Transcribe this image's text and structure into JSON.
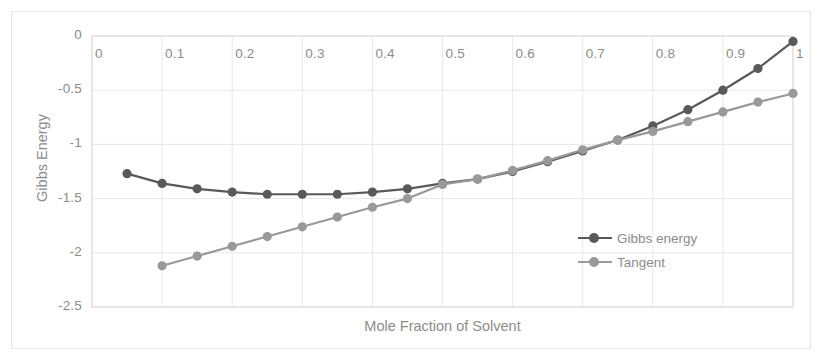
{
  "chart_data": {
    "type": "line",
    "title": "",
    "xlabel": "Mole Fraction of Solvent",
    "ylabel": "Gibbs Energy",
    "xlim": [
      0,
      1
    ],
    "ylim": [
      -2.5,
      0
    ],
    "xticks": [
      "0",
      "0.1",
      "0.2",
      "0.3",
      "0.4",
      "0.5",
      "0.6",
      "0.7",
      "0.8",
      "0.9",
      "1"
    ],
    "xtick_values": [
      0,
      0.1,
      0.2,
      0.3,
      0.4,
      0.5,
      0.6,
      0.7,
      0.8,
      0.9,
      1
    ],
    "yticks": [
      "0",
      "-0.5",
      "-1",
      "-1.5",
      "-2",
      "-2.5"
    ],
    "ytick_values": [
      0,
      -0.5,
      -1,
      -1.5,
      -2,
      -2.5
    ],
    "grid": true,
    "legend_position": "inside-lower-right",
    "markers": "circle",
    "series": [
      {
        "name": "Gibbs energy",
        "color": "#595959",
        "x": [
          0.05,
          0.1,
          0.15,
          0.2,
          0.25,
          0.3,
          0.35,
          0.4,
          0.45,
          0.5,
          0.55,
          0.6,
          0.65,
          0.7,
          0.75,
          0.8,
          0.85,
          0.9,
          0.95,
          1.0
        ],
        "values": [
          -1.27,
          -1.36,
          -1.41,
          -1.44,
          -1.46,
          -1.46,
          -1.46,
          -1.44,
          -1.41,
          -1.36,
          -1.32,
          -1.25,
          -1.16,
          -1.06,
          -0.96,
          -0.83,
          -0.68,
          -0.5,
          -0.3,
          -0.05
        ]
      },
      {
        "name": "Tangent",
        "color": "#999999",
        "x": [
          0.1,
          0.15,
          0.2,
          0.25,
          0.3,
          0.35,
          0.4,
          0.45,
          0.5,
          0.55,
          0.6,
          0.65,
          0.7,
          0.75,
          0.8,
          0.85,
          0.9,
          0.95,
          1.0
        ],
        "values": [
          -2.12,
          -2.03,
          -1.94,
          -1.85,
          -1.76,
          -1.67,
          -1.58,
          -1.5,
          -1.37,
          -1.32,
          -1.24,
          -1.15,
          -1.05,
          -0.96,
          -0.88,
          -0.79,
          -0.7,
          -0.61,
          -0.53
        ]
      }
    ]
  },
  "legend": {
    "items": [
      {
        "label": "Gibbs energy",
        "color": "#595959"
      },
      {
        "label": "Tangent",
        "color": "#999999"
      }
    ]
  },
  "axes": {
    "y_title": "Gibbs Energy",
    "x_title": "Mole Fraction of Solvent"
  },
  "style": {
    "grid_color": "#e8e8e8",
    "text_color": "#8c8c8c",
    "frame_color": "#e6e6e6",
    "background": "#ffffff"
  }
}
